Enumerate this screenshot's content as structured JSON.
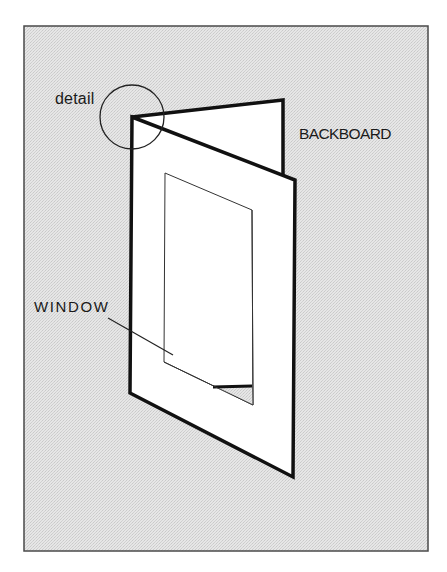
{
  "diagram": {
    "labels": {
      "detail": "detail",
      "backboard": "BACKBOARD",
      "window": "WINDOW"
    },
    "colors": {
      "background_fill": "#e3e3e3",
      "frame_border": "#4a4a4a",
      "board_fill": "#ffffff",
      "outline": "#111111",
      "text": "#1a1a1a"
    },
    "parts": [
      {
        "name": "frame",
        "type": "rect"
      },
      {
        "name": "backboard",
        "type": "panel",
        "label_key": "backboard"
      },
      {
        "name": "window-mat",
        "type": "panel"
      },
      {
        "name": "window-opening",
        "type": "cutout",
        "label_key": "window"
      },
      {
        "name": "detail-circle",
        "type": "callout",
        "label_key": "detail"
      },
      {
        "name": "window-leader",
        "type": "leader-line"
      }
    ]
  }
}
